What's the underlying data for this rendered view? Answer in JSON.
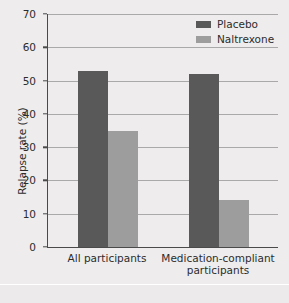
{
  "chart_data": {
    "type": "bar",
    "title": "",
    "subtitle": "",
    "xlabel": "",
    "ylabel": "Relapse rate (%)",
    "ylim": [
      0,
      70
    ],
    "yticks": [
      0,
      10,
      20,
      30,
      40,
      50,
      60,
      70
    ],
    "ytick_labels": [
      "0",
      "10",
      "20",
      "30",
      "40",
      "50",
      "60",
      "70"
    ],
    "grid": "horizontal",
    "legend_position": "top-right",
    "categories": [
      "All participants",
      "Medication-compliant\nparticipants"
    ],
    "series": [
      {
        "name": "Placebo",
        "color": "#595959",
        "values": [
          53,
          52
        ]
      },
      {
        "name": "Naltrexone",
        "color": "#9d9d9d",
        "values": [
          35,
          14
        ]
      }
    ]
  },
  "legend": {
    "items": [
      {
        "label": "Placebo",
        "swatch": "placebo-swatch"
      },
      {
        "label": "Naltrexone",
        "swatch": "naltrexone-swatch"
      }
    ]
  },
  "axis": {
    "y_title": "Relapse rate (%)"
  }
}
